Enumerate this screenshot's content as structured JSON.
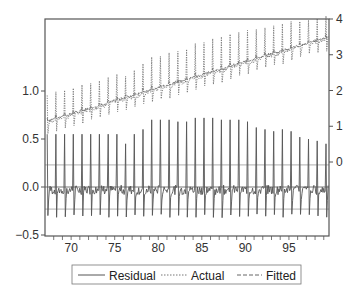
{
  "chart_data": {
    "type": "line",
    "title": "",
    "xlabel": "",
    "ylabel_left": "",
    "ylabel_right": "",
    "x_range": [
      67,
      99.6
    ],
    "x_ticks": [
      70,
      75,
      80,
      85,
      90,
      95
    ],
    "x_tick_labels": [
      "70",
      "75",
      "80",
      "85",
      "90",
      "95"
    ],
    "y_left": {
      "axis": "residual",
      "range": [
        -0.5,
        1.75
      ],
      "ticks": [
        -0.5,
        0.0,
        0.5,
        1.0
      ],
      "tick_labels": [
        "-0.5",
        "0.0",
        "0.5",
        "1.0"
      ]
    },
    "y_right": {
      "axis": "actual/fitted",
      "range": [
        0,
        4
      ],
      "ticks": [
        0,
        1,
        2,
        3,
        4
      ],
      "tick_labels": [
        "0",
        "1",
        "2",
        "3",
        "4"
      ]
    },
    "residual_reference_lines": {
      "zero": 0.0,
      "plus_se": 0.23,
      "minus_se": -0.23
    },
    "grid": false,
    "legend_position": "bottom",
    "series": [
      {
        "name": "Residual",
        "axis": "left",
        "style": "solid",
        "annual_spike_peaks": [
          0.55,
          0.55,
          0.55,
          0.55,
          0.55,
          0.55,
          0.55,
          0.55,
          0.55,
          0.45,
          0.55,
          0.6,
          0.7,
          0.7,
          0.7,
          0.68,
          0.68,
          0.72,
          0.72,
          0.72,
          0.7,
          0.7,
          0.7,
          0.68,
          0.62,
          0.6,
          0.58,
          0.6,
          0.58,
          0.52,
          0.5,
          0.48,
          0.45
        ],
        "trough": -0.32,
        "baseline_noise": 0.05
      },
      {
        "name": "Actual",
        "axis": "right",
        "style": "dotted",
        "trend_start": 1.15,
        "trend_end": 3.5,
        "spike_amplitude": 0.85,
        "dip_amplitude": 0.4
      },
      {
        "name": "Fitted",
        "axis": "right",
        "style": "dashed",
        "trend_start": 1.15,
        "trend_end": 3.5
      }
    ]
  },
  "legend": {
    "items": [
      {
        "label": "Residual",
        "style": "solid"
      },
      {
        "label": "Actual",
        "style": "dotted"
      },
      {
        "label": "Fitted",
        "style": "dashed"
      }
    ]
  },
  "colors": {
    "line": "#555555",
    "frame": "#555555",
    "ref_line": "#888888",
    "text": "#333333"
  }
}
